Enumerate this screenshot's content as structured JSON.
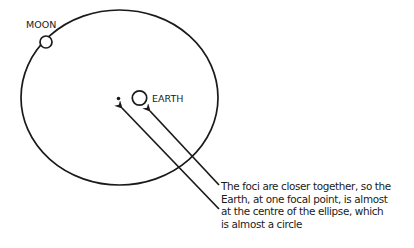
{
  "diagram": {
    "type": "orbit-ellipse",
    "colors": {
      "stroke": "#1a1a1a",
      "background": "#ffffff"
    },
    "labels": {
      "moon": "MOON",
      "earth": "EARTH"
    },
    "caption": {
      "lines": [
        "The foci are closer together, so the",
        "Earth, at one focal point, is almost",
        "at the centre of the ellipse, which",
        "is almost a circle"
      ]
    },
    "icons": {
      "moon": "circle-outline",
      "earth": "circle-outline",
      "empty_focus": "dot",
      "pointer_arrows": 2
    }
  }
}
